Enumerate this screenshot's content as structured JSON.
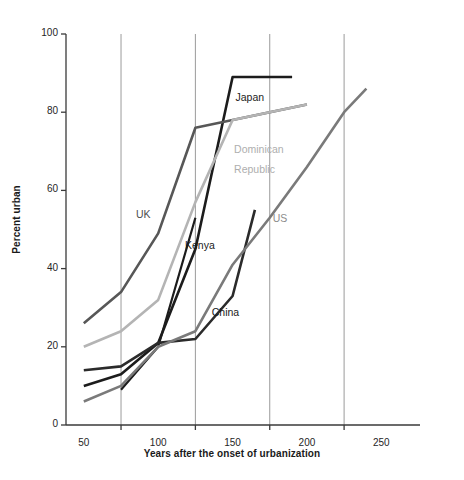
{
  "chart_data": {
    "type": "line",
    "title": "",
    "xlabel": "Years after the onset of urbanization",
    "ylabel": "Percent urban",
    "xlim": [
      38,
      272
    ],
    "ylim": [
      0,
      100
    ],
    "xticks": [
      75,
      125,
      175,
      225
    ],
    "xtick_labels": [
      "50",
      "100",
      "150",
      "200",
      "250"
    ],
    "xtick_label_values": [
      50,
      100,
      150,
      200,
      250
    ],
    "yticks": [
      0,
      20,
      40,
      60,
      80,
      100
    ],
    "ytick_labels": [
      "0",
      "20",
      "40",
      "60",
      "80",
      "100"
    ],
    "grid": "vertical gridlines at 75, 125, 175, 225",
    "legend": "inline labels next to lines",
    "series": [
      {
        "name": "Japan",
        "color": "#1c1c1c",
        "width": 2.6,
        "label_x": 152,
        "label_y": 84,
        "label_color": "#1a1a1a",
        "points": [
          [
            50,
            10
          ],
          [
            75,
            13
          ],
          [
            100,
            21
          ],
          [
            125,
            45
          ],
          [
            150,
            89
          ],
          [
            190,
            89
          ]
        ]
      },
      {
        "name": "UK",
        "color": "#575757",
        "width": 2.6,
        "label_x": 86,
        "label_y": 54,
        "label_color": "#4d4d4d",
        "points": [
          [
            50,
            26
          ],
          [
            75,
            34
          ],
          [
            100,
            49
          ],
          [
            125,
            76
          ],
          [
            150,
            78
          ],
          [
            200,
            82
          ]
        ]
      },
      {
        "name": "Dominican Republic",
        "color": "#b4b4b4",
        "width": 2.6,
        "label_x": 153,
        "label_y": 70,
        "label_color": "#a8a8a8",
        "points": [
          [
            50,
            20
          ],
          [
            75,
            24
          ],
          [
            100,
            32
          ],
          [
            125,
            57
          ],
          [
            150,
            78
          ],
          [
            200,
            82
          ]
        ]
      },
      {
        "name": "Kenya",
        "color": "#1c1c1c",
        "width": 2.2,
        "label_x": 120,
        "label_y": 46,
        "label_color": "#1a1a1a",
        "points": [
          [
            75,
            9
          ],
          [
            100,
            20
          ],
          [
            125,
            53
          ]
        ]
      },
      {
        "name": "China",
        "color": "#2b2b2b",
        "width": 2.6,
        "label_x": 137,
        "label_y": 29,
        "label_color": "#1a1a1a",
        "points": [
          [
            50,
            14
          ],
          [
            75,
            15
          ],
          [
            100,
            21
          ],
          [
            125,
            22
          ],
          [
            150,
            33
          ],
          [
            165,
            55
          ]
        ]
      },
      {
        "name": "US",
        "color": "#7a7a7a",
        "width": 2.6,
        "label_x": 178,
        "label_y": 53,
        "label_color": "#8c8c8c",
        "points": [
          [
            50,
            6
          ],
          [
            75,
            10
          ],
          [
            100,
            20
          ],
          [
            125,
            24
          ],
          [
            150,
            41
          ],
          [
            175,
            53
          ],
          [
            200,
            66
          ],
          [
            225,
            80
          ],
          [
            240,
            86
          ]
        ]
      }
    ],
    "labels": [
      {
        "text": "Japan",
        "x": 152,
        "y": 84
      },
      {
        "text": "UK",
        "x": 86,
        "y": 54
      },
      {
        "text": "Dominican",
        "x": 153,
        "y": 70
      },
      {
        "text": "Republic",
        "x": 153,
        "y": 65
      },
      {
        "text": "Kenya",
        "x": 120,
        "y": 46
      },
      {
        "text": "China",
        "x": 137,
        "y": 29
      },
      {
        "text": "US",
        "x": 178,
        "y": 53
      }
    ]
  },
  "axes": {
    "x_label": "Years after the onset of urbanization",
    "y_label": "Percent urban",
    "y_ticks": [
      "0",
      "20",
      "40",
      "60",
      "80",
      "100"
    ],
    "x_ticks": [
      "50",
      "100",
      "150",
      "200",
      "250"
    ]
  },
  "series_labels": {
    "japan": "Japan",
    "uk": "UK",
    "dominican_line1": "Dominican",
    "dominican_line2": "Republic",
    "kenya": "Kenya",
    "china": "China",
    "us": "US"
  },
  "colors": {
    "axis": "#3a3a3a",
    "grid": "#8e8e8e",
    "japan": "#1c1c1c",
    "uk": "#575757",
    "dominican": "#b4b4b4",
    "kenya": "#1c1c1c",
    "china": "#2b2b2b",
    "us": "#7a7a7a"
  }
}
